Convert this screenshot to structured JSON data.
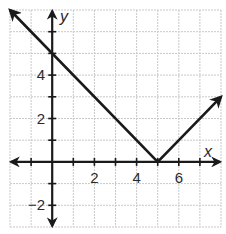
{
  "chart_data": {
    "type": "line",
    "title": "",
    "xlabel": "x",
    "ylabel": "y",
    "xlim": [
      -2,
      8
    ],
    "ylim": [
      -3,
      7
    ],
    "grid": true,
    "x_ticks": [
      -1,
      0,
      1,
      2,
      3,
      4,
      5,
      6,
      7
    ],
    "y_ticks": [
      -2,
      -1,
      1,
      2,
      3,
      4,
      5,
      6
    ],
    "x_tick_labels": [
      {
        "value": 2,
        "label": "2"
      },
      {
        "value": 4,
        "label": "4"
      },
      {
        "value": 6,
        "label": "6"
      }
    ],
    "y_tick_labels": [
      {
        "value": 4,
        "label": "4"
      },
      {
        "value": 2,
        "label": "2"
      },
      {
        "value": -2,
        "label": "−2"
      }
    ],
    "series": [
      {
        "name": "y = |x - 5|",
        "points": [
          [
            -2,
            7
          ],
          [
            5,
            0
          ],
          [
            8,
            3
          ]
        ],
        "arrows": "both",
        "color": "#1a1a1a"
      }
    ],
    "colors": {
      "grid": "#c8c8c8",
      "axis": "#1a1a1a",
      "line": "#1a1a1a"
    }
  }
}
